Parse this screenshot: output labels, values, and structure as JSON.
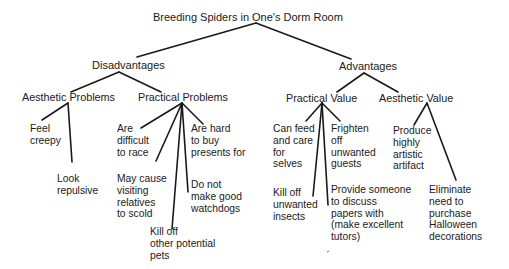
{
  "diagram": {
    "type": "tree",
    "root": "Breeding Spiders in One's Dorm Room",
    "branches": {
      "disadvantages": {
        "label": "Disadvantages",
        "aesthetic_problems": {
          "label": "Aesthetic Problems",
          "leaves": [
            [
              "Feel",
              "creepy"
            ],
            [
              "Look",
              "repulsive"
            ]
          ]
        },
        "practical_problems": {
          "label": "Practical Problems",
          "leaves": [
            [
              "Are",
              "difficult",
              "to race"
            ],
            [
              "May cause",
              "visiting",
              "relatives",
              "to scold"
            ],
            [
              "Kill off",
              "other potential",
              "pets"
            ],
            [
              "Do not",
              "make good",
              "watchdogs"
            ],
            [
              "Are hard",
              "to buy",
              "presents for"
            ]
          ]
        }
      },
      "advantages": {
        "label": "Advantages",
        "practical_value": {
          "label": "Practical Value",
          "leaves": [
            [
              "Can feed",
              "and care",
              "for",
              "selves"
            ],
            [
              "Kill off",
              "unwanted",
              "insects"
            ],
            [
              "Provide someone",
              "to discuss",
              "papers with",
              "(make excellent",
              "tutors)"
            ],
            [
              "Frighten",
              "off",
              "unwanted",
              "guests"
            ]
          ]
        },
        "aesthetic_value": {
          "label": "Aesthetic Value",
          "leaves": [
            [
              "Produce",
              "highly",
              "artistic",
              "artifact"
            ],
            [
              "Eliminate",
              "need to",
              "purchase",
              "Halloween",
              "decorations"
            ]
          ]
        }
      }
    }
  }
}
